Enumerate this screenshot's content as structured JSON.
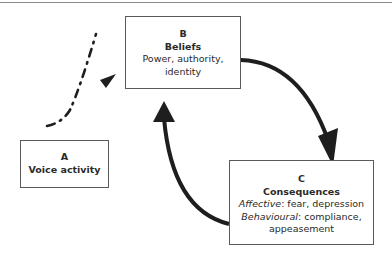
{
  "diagram": {
    "nodes": {
      "a": {
        "letter": "A",
        "title": "Voice activity"
      },
      "b": {
        "letter": "B",
        "title": "Beliefs",
        "lines": [
          "Power, authority,",
          "identity"
        ]
      },
      "c": {
        "letter": "C",
        "title": "Consequences",
        "affective_label": "Affective",
        "affective_text": ": fear, depression",
        "behavioural_label": "Behavioural",
        "behavioural_text": ": compliance,",
        "last_line": "appeasement"
      }
    },
    "edges": [
      {
        "from": "A",
        "to": "B",
        "style": "dash-dot"
      },
      {
        "from": "B",
        "to": "C",
        "style": "solid"
      },
      {
        "from": "C",
        "to": "B",
        "style": "solid"
      }
    ]
  }
}
